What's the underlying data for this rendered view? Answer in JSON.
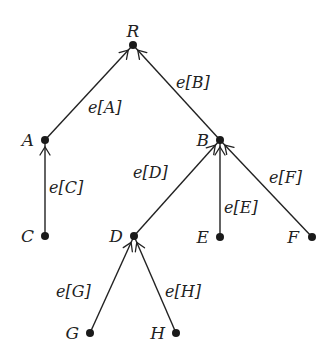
{
  "diagram": {
    "type": "rooted-tree",
    "direction": "edges point from child to parent",
    "nodes": [
      {
        "id": "R",
        "label": "R",
        "x": 133,
        "y": 45,
        "label_x": 133,
        "label_y": 37,
        "label_anchor": "middle"
      },
      {
        "id": "A",
        "label": "A",
        "x": 45,
        "y": 140,
        "label_x": 34,
        "label_y": 146,
        "label_anchor": "end"
      },
      {
        "id": "B",
        "label": "B",
        "x": 220,
        "y": 140,
        "label_x": 209,
        "label_y": 146,
        "label_anchor": "end"
      },
      {
        "id": "C",
        "label": "C",
        "x": 45,
        "y": 236,
        "label_x": 34,
        "label_y": 242,
        "label_anchor": "end"
      },
      {
        "id": "D",
        "label": "D",
        "x": 134,
        "y": 236,
        "label_x": 123,
        "label_y": 242,
        "label_anchor": "end"
      },
      {
        "id": "E",
        "label": "E",
        "x": 220,
        "y": 237,
        "label_x": 209,
        "label_y": 243,
        "label_anchor": "end"
      },
      {
        "id": "F",
        "label": "F",
        "x": 312,
        "y": 237,
        "label_x": 299,
        "label_y": 243,
        "label_anchor": "end"
      },
      {
        "id": "G",
        "label": "G",
        "x": 90,
        "y": 333,
        "label_x": 79,
        "label_y": 339,
        "label_anchor": "end"
      },
      {
        "id": "H",
        "label": "H",
        "x": 176,
        "y": 333,
        "label_x": 165,
        "label_y": 339,
        "label_anchor": "end"
      }
    ],
    "edges": [
      {
        "from": "A",
        "to": "R",
        "label": "e[A]",
        "label_x": 88,
        "label_y": 113
      },
      {
        "from": "B",
        "to": "R",
        "label": "e[B]",
        "label_x": 176,
        "label_y": 88
      },
      {
        "from": "C",
        "to": "A",
        "label": "e[C]",
        "label_x": 49,
        "label_y": 193
      },
      {
        "from": "D",
        "to": "B",
        "label": "e[D]",
        "label_x": 133,
        "label_y": 178
      },
      {
        "from": "E",
        "to": "B",
        "label": "e[E]",
        "label_x": 224,
        "label_y": 213
      },
      {
        "from": "F",
        "to": "B",
        "label": "e[F]",
        "label_x": 269,
        "label_y": 183
      },
      {
        "from": "G",
        "to": "D",
        "label": "e[G]",
        "label_x": 56,
        "label_y": 297
      },
      {
        "from": "H",
        "to": "D",
        "label": "e[H]",
        "label_x": 165,
        "label_y": 297
      }
    ]
  },
  "style": {
    "line_color": "#222222",
    "node_color": "#1a1a1a",
    "background": "#ffffff"
  }
}
